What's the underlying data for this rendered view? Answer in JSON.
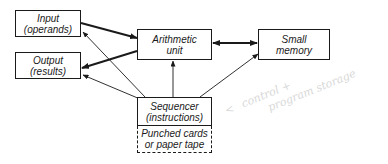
{
  "diagram": {
    "colors": {
      "ink": "#1a1a1a",
      "annotation": "#d8d8d8",
      "background": "#ffffff"
    },
    "nodes": [
      {
        "id": "input",
        "line1": "Input",
        "line2": "(operands)"
      },
      {
        "id": "output",
        "line1": "Output",
        "line2": "(results)"
      },
      {
        "id": "arithmetic",
        "line1": "Arithmetic",
        "line2": "unit"
      },
      {
        "id": "memory",
        "line1": "Small",
        "line2": "memory"
      },
      {
        "id": "sequencer",
        "line1": "Sequencer",
        "line2": "(instructions)"
      },
      {
        "id": "punched",
        "line1": "Punched cards",
        "line2": "or paper tape"
      }
    ],
    "edges": [
      {
        "from": "input",
        "to": "arithmetic",
        "style": "thick"
      },
      {
        "from": "arithmetic",
        "to": "output",
        "style": "thick"
      },
      {
        "from": "arithmetic",
        "to": "memory",
        "style": "thick-bidirectional"
      },
      {
        "from": "sequencer",
        "to": "input",
        "style": "thin"
      },
      {
        "from": "sequencer",
        "to": "output",
        "style": "thin"
      },
      {
        "from": "sequencer",
        "to": "arithmetic",
        "style": "thin"
      },
      {
        "from": "sequencer",
        "to": "memory",
        "style": "thin"
      }
    ],
    "annotation": {
      "arrow": "<",
      "line1": "control +",
      "line2": "program storage"
    }
  }
}
